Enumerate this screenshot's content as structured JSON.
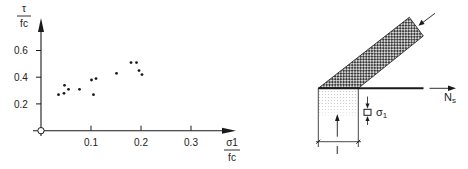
{
  "chart_data": {
    "type": "scatter",
    "title": "",
    "xlabel": "σ1 / fc",
    "ylabel": "τ / fc",
    "xlabel_num": "σ1",
    "xlabel_den": "fc",
    "ylabel_num": "τ",
    "ylabel_den": "fc",
    "xlim": [
      0,
      0.35
    ],
    "ylim": [
      0,
      0.7
    ],
    "x_ticks": [
      "0.1",
      "0.2",
      "0.3"
    ],
    "x_tick_values": [
      0.1,
      0.2,
      0.3
    ],
    "y_ticks": [
      "0.2",
      "0.4",
      "0.6"
    ],
    "y_tick_values": [
      0.2,
      0.4,
      0.6
    ],
    "grid": false,
    "legend": null,
    "points": [
      {
        "x": 0.035,
        "y": 0.27
      },
      {
        "x": 0.046,
        "y": 0.28
      },
      {
        "x": 0.047,
        "y": 0.34
      },
      {
        "x": 0.055,
        "y": 0.31
      },
      {
        "x": 0.077,
        "y": 0.31
      },
      {
        "x": 0.101,
        "y": 0.38
      },
      {
        "x": 0.105,
        "y": 0.27
      },
      {
        "x": 0.11,
        "y": 0.39
      },
      {
        "x": 0.151,
        "y": 0.43
      },
      {
        "x": 0.18,
        "y": 0.51
      },
      {
        "x": 0.191,
        "y": 0.51
      },
      {
        "x": 0.196,
        "y": 0.45
      },
      {
        "x": 0.202,
        "y": 0.42
      }
    ]
  },
  "diagram": {
    "labels": {
      "force_label": "N",
      "force_sub": "s",
      "stress_label": "σ",
      "stress_sub": "1",
      "length_label": "l"
    }
  }
}
